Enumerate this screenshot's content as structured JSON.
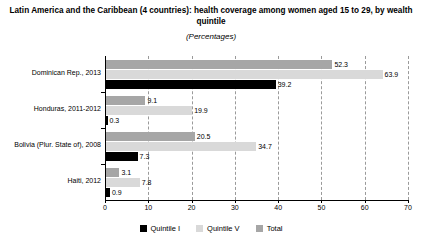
{
  "chart_data": {
    "type": "bar",
    "orientation": "horizontal",
    "title": "Latin America and the Caribbean (4 countries): health coverage among women aged 15 to 29, by wealth quintile",
    "subtitle": "(Percentages)",
    "xlabel": "",
    "ylabel": "",
    "xlim": [
      0,
      70
    ],
    "xticks": [
      0,
      10,
      20,
      30,
      40,
      50,
      60,
      70
    ],
    "grid": true,
    "legend_position": "bottom-center",
    "categories": [
      "Dominican Rep., 2013",
      "Honduras, 2011-2012",
      "Bolivia (Plur. State of), 2008",
      "Haiti, 2012"
    ],
    "series": [
      {
        "name": "Total",
        "color": "#a6a6a6",
        "values": [
          52.3,
          9.1,
          20.5,
          3.1
        ]
      },
      {
        "name": "Quintile V",
        "color": "#d9d9d9",
        "values": [
          63.9,
          19.9,
          34.7,
          7.8
        ]
      },
      {
        "name": "Quintile I",
        "color": "#000000",
        "values": [
          39.2,
          0.3,
          7.3,
          0.9
        ]
      }
    ],
    "legend": [
      {
        "label": "Quintile I",
        "color": "#000000"
      },
      {
        "label": "Quintile V",
        "color": "#d9d9d9"
      },
      {
        "label": "Total",
        "color": "#a6a6a6"
      }
    ],
    "value_labels": {
      "dominican_total": "52.3",
      "dominican_quintile_v": "63.9",
      "dominican_quintile_i": "39.2",
      "honduras_total": "9.1",
      "honduras_quintile_v": "19.9",
      "honduras_quintile_i": "0.3",
      "bolivia_total": "20.5",
      "bolivia_quintile_v": "34.7",
      "bolivia_quintile_i": "7.3",
      "haiti_total": "3.1",
      "haiti_quintile_v": "7.8",
      "haiti_quintile_i": "0.9"
    },
    "tick_labels": [
      "0",
      "10",
      "20",
      "30",
      "40",
      "50",
      "60",
      "70"
    ]
  }
}
